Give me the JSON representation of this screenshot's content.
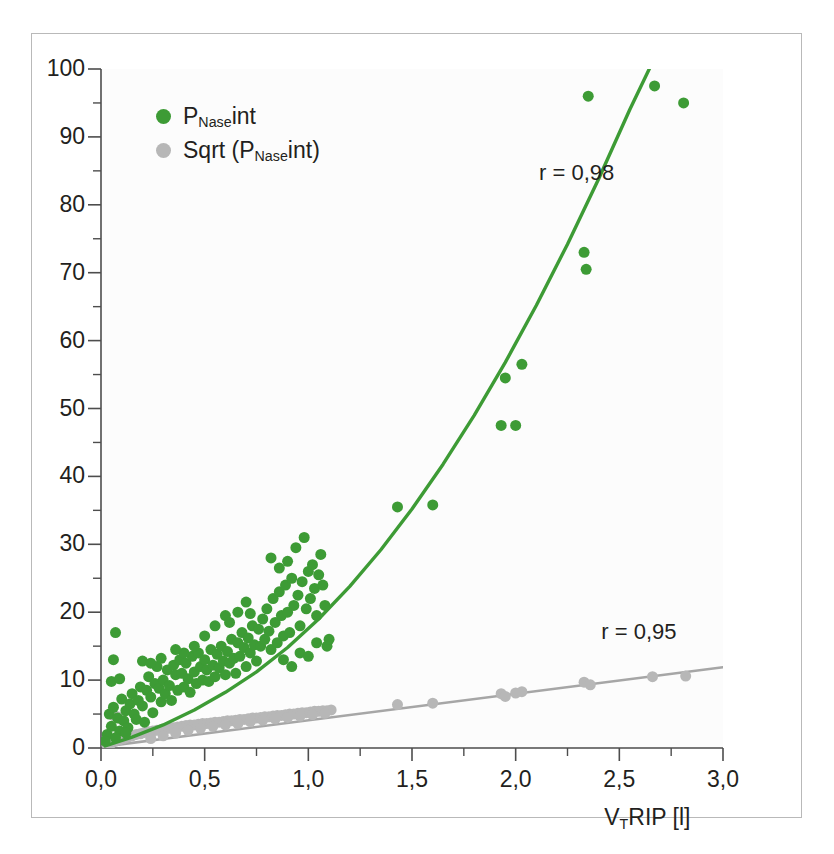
{
  "figure": {
    "background_color": "#ffffff",
    "frame_color": "#b9b9b9",
    "axis_color": "#4d4d4d"
  },
  "legend": {
    "items": [
      {
        "label_main": "P",
        "label_sub": "Nase",
        "label_tail": "int",
        "color": "#3d9b35",
        "name": "pnase-int"
      },
      {
        "label_main": "Sqrt (P",
        "label_sub": "Nase",
        "label_tail": "int)",
        "color": "#b7b7b7",
        "name": "sqrt-pnase-int"
      }
    ]
  },
  "annotations": [
    {
      "text": "r = 0,98",
      "x": 2.33,
      "y": 84.5,
      "name": "r-value-green"
    },
    {
      "text": "r = 0,95",
      "x": 2.63,
      "y": 17.0,
      "name": "r-value-gray"
    }
  ],
  "axis_title_x": {
    "main": "V",
    "sub": "T",
    "tail": "RIP [l]"
  },
  "chart_data": {
    "type": "scatter",
    "title": "",
    "xlabel": "V_T RIP [l]",
    "ylabel": "",
    "xlim": [
      0.0,
      3.0
    ],
    "ylim": [
      0,
      100
    ],
    "grid": false,
    "legend_position": "top-left",
    "x_ticks": [
      0.0,
      0.5,
      1.0,
      1.5,
      2.0,
      2.5,
      3.0
    ],
    "x_tick_labels": [
      "0,0",
      "0,5",
      "1,0",
      "1,5",
      "2,0",
      "2,5",
      "3,0"
    ],
    "x_minor_step": 0.25,
    "y_ticks": [
      0,
      10,
      20,
      30,
      40,
      50,
      60,
      70,
      80,
      90,
      100
    ],
    "y_tick_labels": [
      "0",
      "10",
      "20",
      "30",
      "40",
      "50",
      "60",
      "70",
      "80",
      "90",
      "100"
    ],
    "y_minor_step": 5,
    "series": [
      {
        "name": "P_Nase int",
        "color": "#3d9b35",
        "marker": "circle",
        "marker_size": 11,
        "correlation": "r = 0,98",
        "fit_type": "quadratic",
        "fit_color": "#3d9b35",
        "fit_points": [
          [
            0.02,
            0.3
          ],
          [
            0.15,
            1.6
          ],
          [
            0.3,
            3.4
          ],
          [
            0.45,
            5.6
          ],
          [
            0.6,
            8.2
          ],
          [
            0.75,
            11.2
          ],
          [
            0.9,
            14.8
          ],
          [
            1.05,
            19.0
          ],
          [
            1.2,
            23.8
          ],
          [
            1.35,
            29.2
          ],
          [
            1.5,
            35.2
          ],
          [
            1.65,
            41.8
          ],
          [
            1.8,
            49.0
          ],
          [
            1.95,
            56.8
          ],
          [
            2.1,
            65.2
          ],
          [
            2.25,
            74.2
          ],
          [
            2.4,
            83.8
          ],
          [
            2.55,
            94.0
          ],
          [
            2.66,
            101.0
          ]
        ],
        "points": [
          [
            0.07,
            17.0
          ],
          [
            0.06,
            13.0
          ],
          [
            0.05,
            9.8
          ],
          [
            0.09,
            10.2
          ],
          [
            0.04,
            5.0
          ],
          [
            0.03,
            2.0
          ],
          [
            0.02,
            1.0
          ],
          [
            0.05,
            3.2
          ],
          [
            0.08,
            4.4
          ],
          [
            0.06,
            6.0
          ],
          [
            0.1,
            7.2
          ],
          [
            0.11,
            4.0
          ],
          [
            0.12,
            5.5
          ],
          [
            0.09,
            2.5
          ],
          [
            0.07,
            1.5
          ],
          [
            0.13,
            3.0
          ],
          [
            0.14,
            6.5
          ],
          [
            0.15,
            8.0
          ],
          [
            0.16,
            5.0
          ],
          [
            0.12,
            2.2
          ],
          [
            0.17,
            4.2
          ],
          [
            0.18,
            7.0
          ],
          [
            0.19,
            9.0
          ],
          [
            0.2,
            6.2
          ],
          [
            0.21,
            3.8
          ],
          [
            0.22,
            8.5
          ],
          [
            0.23,
            10.5
          ],
          [
            0.24,
            7.5
          ],
          [
            0.25,
            5.2
          ],
          [
            0.26,
            9.5
          ],
          [
            0.27,
            12.0
          ],
          [
            0.28,
            8.8
          ],
          [
            0.2,
            12.8
          ],
          [
            0.24,
            12.5
          ],
          [
            0.29,
            6.8
          ],
          [
            0.3,
            10.0
          ],
          [
            0.31,
            8.0
          ],
          [
            0.32,
            11.5
          ],
          [
            0.33,
            9.2
          ],
          [
            0.34,
            7.0
          ],
          [
            0.35,
            12.2
          ],
          [
            0.36,
            10.8
          ],
          [
            0.37,
            8.5
          ],
          [
            0.38,
            13.0
          ],
          [
            0.29,
            13.2
          ],
          [
            0.39,
            11.0
          ],
          [
            0.4,
            9.0
          ],
          [
            0.41,
            12.5
          ],
          [
            0.42,
            10.2
          ],
          [
            0.43,
            8.2
          ],
          [
            0.44,
            13.5
          ],
          [
            0.45,
            11.2
          ],
          [
            0.46,
            9.5
          ],
          [
            0.47,
            14.0
          ],
          [
            0.48,
            12.0
          ],
          [
            0.49,
            10.0
          ],
          [
            0.5,
            13.0
          ],
          [
            0.51,
            11.5
          ],
          [
            0.52,
            9.8
          ],
          [
            0.53,
            14.5
          ],
          [
            0.54,
            12.2
          ],
          [
            0.55,
            10.5
          ],
          [
            0.56,
            13.8
          ],
          [
            0.57,
            11.8
          ],
          [
            0.58,
            15.0
          ],
          [
            0.59,
            12.8
          ],
          [
            0.6,
            10.8
          ],
          [
            0.61,
            14.2
          ],
          [
            0.62,
            12.5
          ],
          [
            0.63,
            16.0
          ],
          [
            0.64,
            13.2
          ],
          [
            0.65,
            11.0
          ],
          [
            0.66,
            15.5
          ],
          [
            0.67,
            13.5
          ],
          [
            0.68,
            17.0
          ],
          [
            0.69,
            14.8
          ],
          [
            0.7,
            12.0
          ],
          [
            0.71,
            16.2
          ],
          [
            0.72,
            14.0
          ],
          [
            0.73,
            18.0
          ],
          [
            0.74,
            15.2
          ],
          [
            0.75,
            12.8
          ],
          [
            0.76,
            17.5
          ],
          [
            0.77,
            15.0
          ],
          [
            0.78,
            19.0
          ],
          [
            0.6,
            19.5
          ],
          [
            0.62,
            18.5
          ],
          [
            0.66,
            20.0
          ],
          [
            0.7,
            21.5
          ],
          [
            0.72,
            19.8
          ],
          [
            0.55,
            18.0
          ],
          [
            0.5,
            16.5
          ],
          [
            0.45,
            15.0
          ],
          [
            0.4,
            14.0
          ],
          [
            0.36,
            14.5
          ],
          [
            0.79,
            16.0
          ],
          [
            0.8,
            20.5
          ],
          [
            0.81,
            17.2
          ],
          [
            0.82,
            14.5
          ],
          [
            0.83,
            22.0
          ],
          [
            0.84,
            18.5
          ],
          [
            0.85,
            15.5
          ],
          [
            0.86,
            23.0
          ],
          [
            0.87,
            19.5
          ],
          [
            0.88,
            16.5
          ],
          [
            0.89,
            24.0
          ],
          [
            0.9,
            20.0
          ],
          [
            0.91,
            17.0
          ],
          [
            0.92,
            25.0
          ],
          [
            0.93,
            21.0
          ],
          [
            0.82,
            28.0
          ],
          [
            0.86,
            26.5
          ],
          [
            0.9,
            27.5
          ],
          [
            0.94,
            29.5
          ],
          [
            0.98,
            31.0
          ],
          [
            0.95,
            22.5
          ],
          [
            0.96,
            18.0
          ],
          [
            0.97,
            24.5
          ],
          [
            0.99,
            20.5
          ],
          [
            1.0,
            26.0
          ],
          [
            1.01,
            22.0
          ],
          [
            1.02,
            27.0
          ],
          [
            1.03,
            23.5
          ],
          [
            1.04,
            19.5
          ],
          [
            1.05,
            25.5
          ],
          [
            1.06,
            28.5
          ],
          [
            1.07,
            24.0
          ],
          [
            1.08,
            21.0
          ],
          [
            1.09,
            15.0
          ],
          [
            1.1,
            16.0
          ],
          [
            0.88,
            13.0
          ],
          [
            0.92,
            12.0
          ],
          [
            0.96,
            14.0
          ],
          [
            1.0,
            13.5
          ],
          [
            1.04,
            15.5
          ],
          [
            1.43,
            35.5
          ],
          [
            1.6,
            35.8
          ],
          [
            1.93,
            47.5
          ],
          [
            2.0,
            47.5
          ],
          [
            1.95,
            54.5
          ],
          [
            2.03,
            56.5
          ],
          [
            2.33,
            73.0
          ],
          [
            2.34,
            70.5
          ],
          [
            2.35,
            96.0
          ],
          [
            2.67,
            97.5
          ],
          [
            2.81,
            95.0
          ]
        ]
      },
      {
        "name": "Sqrt (P_Nase int)",
        "color": "#b7b7b7",
        "marker": "circle",
        "marker_size": 11,
        "correlation": "r = 0,95",
        "fit_type": "linear",
        "fit_color": "#a6a6a6",
        "fit_points": [
          [
            0.01,
            0.2
          ],
          [
            3.0,
            11.9
          ]
        ],
        "points": [
          [
            0.03,
            0.4
          ],
          [
            0.05,
            0.7
          ],
          [
            0.07,
            1.0
          ],
          [
            0.09,
            1.2
          ],
          [
            0.11,
            1.4
          ],
          [
            0.13,
            1.6
          ],
          [
            0.15,
            1.8
          ],
          [
            0.17,
            2.0
          ],
          [
            0.19,
            2.1
          ],
          [
            0.21,
            2.3
          ],
          [
            0.23,
            2.4
          ],
          [
            0.25,
            2.5
          ],
          [
            0.27,
            2.6
          ],
          [
            0.29,
            2.7
          ],
          [
            0.31,
            2.8
          ],
          [
            0.33,
            2.9
          ],
          [
            0.35,
            3.0
          ],
          [
            0.37,
            3.1
          ],
          [
            0.39,
            3.2
          ],
          [
            0.41,
            3.3
          ],
          [
            0.43,
            3.4
          ],
          [
            0.45,
            3.4
          ],
          [
            0.47,
            3.5
          ],
          [
            0.49,
            3.6
          ],
          [
            0.51,
            3.6
          ],
          [
            0.53,
            3.7
          ],
          [
            0.55,
            3.8
          ],
          [
            0.57,
            3.8
          ],
          [
            0.59,
            3.9
          ],
          [
            0.61,
            4.0
          ],
          [
            0.63,
            4.0
          ],
          [
            0.65,
            4.1
          ],
          [
            0.67,
            4.2
          ],
          [
            0.69,
            4.2
          ],
          [
            0.71,
            4.3
          ],
          [
            0.73,
            4.4
          ],
          [
            0.75,
            4.4
          ],
          [
            0.77,
            4.5
          ],
          [
            0.79,
            4.6
          ],
          [
            0.81,
            4.6
          ],
          [
            0.83,
            4.7
          ],
          [
            0.85,
            4.8
          ],
          [
            0.87,
            4.8
          ],
          [
            0.89,
            4.9
          ],
          [
            0.91,
            5.0
          ],
          [
            0.93,
            5.0
          ],
          [
            0.95,
            5.1
          ],
          [
            0.97,
            5.2
          ],
          [
            0.99,
            5.2
          ],
          [
            1.01,
            5.3
          ],
          [
            1.03,
            5.4
          ],
          [
            1.05,
            5.4
          ],
          [
            1.07,
            5.5
          ],
          [
            1.09,
            5.5
          ],
          [
            1.11,
            5.6
          ],
          [
            0.06,
            4.8
          ],
          [
            0.08,
            4.6
          ],
          [
            0.1,
            4.2
          ],
          [
            0.24,
            1.4
          ],
          [
            0.3,
            1.8
          ],
          [
            0.36,
            2.2
          ],
          [
            0.42,
            2.6
          ],
          [
            0.48,
            2.9
          ],
          [
            0.54,
            3.2
          ],
          [
            0.6,
            3.4
          ],
          [
            0.66,
            3.6
          ],
          [
            0.72,
            3.9
          ],
          [
            0.78,
            4.1
          ],
          [
            0.84,
            4.3
          ],
          [
            0.9,
            4.5
          ],
          [
            0.96,
            4.7
          ],
          [
            1.02,
            4.9
          ],
          [
            1.08,
            5.1
          ],
          [
            1.43,
            6.4
          ],
          [
            1.6,
            6.6
          ],
          [
            1.93,
            8.0
          ],
          [
            1.95,
            7.6
          ],
          [
            2.0,
            8.1
          ],
          [
            2.03,
            8.3
          ],
          [
            2.33,
            9.7
          ],
          [
            2.36,
            9.3
          ],
          [
            2.66,
            10.5
          ],
          [
            2.82,
            10.6
          ]
        ]
      }
    ]
  }
}
